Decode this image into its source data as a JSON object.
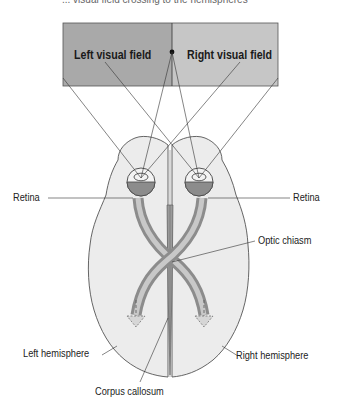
{
  "caption": "... visual field crossing to the hemispheres",
  "visual_field": {
    "left_label": "Left visual field",
    "right_label": "Right visual field",
    "left_color": "#a9a9a9",
    "right_color": "#c6c6c6"
  },
  "labels": {
    "retina_left": "Retina",
    "retina_right": "Retina",
    "optic_chiasm": "Optic chiasm",
    "left_hemisphere": "Left hemisphere",
    "right_hemisphere": "Right hemisphere",
    "corpus_callosum": "Corpus callosum"
  },
  "colors": {
    "brain_fill": "#ececec",
    "nerve_light": "#c8c8c8",
    "nerve_dark": "#8c8c8c",
    "outline": "#555555"
  }
}
